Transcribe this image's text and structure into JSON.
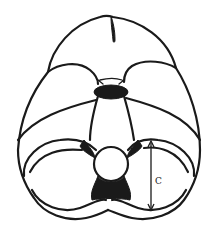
{
  "diagram": {
    "type": "anatomical line drawing",
    "view": "inferior view of brain",
    "colors": {
      "stroke": "#1a1a1a",
      "background": "#ffffff"
    },
    "measurement": {
      "label": "C",
      "orientation": "vertical double-headed arrow",
      "side": "right cerebellar hemisphere"
    }
  }
}
